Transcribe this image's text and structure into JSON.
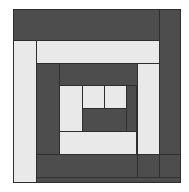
{
  "image": {
    "title": "Log Cabin Quilt Block",
    "width": 189,
    "height": 192,
    "background_color": "#ffffff"
  },
  "palette": {
    "light_fabric": "#e9e9e9",
    "dark_fabric": "#4d4d4d",
    "seam_line": "#2e2e2e"
  },
  "block": {
    "name": "log-cabin",
    "x": 13,
    "y": 9,
    "width": 168,
    "height": 174,
    "winding": "counter-clockwise",
    "center": {
      "label": "center-square",
      "fabric": "light",
      "x": 81,
      "y": 76,
      "width": 22,
      "height": 24
    },
    "logs": [
      {
        "index": 1,
        "label": "log-1-center-left",
        "fabric": "dark",
        "x": 59,
        "y": 76,
        "width": 23,
        "height": 47
      },
      {
        "index": 2,
        "label": "log-2-center-bottom",
        "fabric": "dark",
        "x": 59,
        "y": 99,
        "width": 67,
        "height": 24
      },
      {
        "index": 3,
        "label": "log-3-center-right",
        "fabric": "dark",
        "x": 102,
        "y": 76,
        "width": 24,
        "height": 47
      },
      {
        "index": 4,
        "label": "log-4-ring2-top",
        "fabric": "light",
        "x": 81,
        "y": 54,
        "width": 66,
        "height": 23
      },
      {
        "index": 5,
        "label": "log-5-ring2-left",
        "fabric": "light",
        "x": 59,
        "y": 54,
        "width": 23,
        "height": 92
      },
      {
        "index": 6,
        "label": "log-6-ring2-bottom",
        "fabric": "light",
        "x": 59,
        "y": 122,
        "width": 110,
        "height": 24
      },
      {
        "index": 7,
        "label": "log-7-ring2-right",
        "fabric": "light",
        "x": 125,
        "y": 54,
        "width": 22,
        "height": 92
      },
      {
        "index": 8,
        "label": "log-8-ring3-top",
        "fabric": "dark",
        "x": 37,
        "y": 31,
        "width": 110,
        "height": 24
      },
      {
        "index": 9,
        "label": "log-9-ring3-left",
        "fabric": "dark",
        "x": 37,
        "y": 31,
        "width": 23,
        "height": 138
      },
      {
        "index": 10,
        "label": "log-10-ring3-bottom",
        "fabric": "dark",
        "x": 37,
        "y": 145,
        "width": 154,
        "height": 24
      },
      {
        "index": 11,
        "label": "log-11-ring3-right",
        "fabric": "dark",
        "x": 146,
        "y": 31,
        "width": 23,
        "height": 138
      },
      {
        "index": 12,
        "label": "log-12-ring4-top",
        "fabric": "light",
        "x": 14,
        "y": 31,
        "width": 155,
        "height": 24
      },
      {
        "index": 13,
        "label": "log-13-ring4-left",
        "fabric": "light",
        "x": 14,
        "y": 31,
        "width": 24,
        "height": 152
      },
      {
        "index": 14,
        "label": "log-14-border-top",
        "fabric": "dark",
        "x": 0,
        "y": 0,
        "width": 168,
        "height": 32
      },
      {
        "index": 15,
        "label": "log-15-border-right",
        "fabric": "dark",
        "x": 146,
        "y": 0,
        "width": 22,
        "height": 174
      },
      {
        "index": 16,
        "label": "log-16-border-bottom",
        "fabric": "dark",
        "x": 14,
        "y": 168,
        "width": 154,
        "height": 6
      }
    ]
  }
}
